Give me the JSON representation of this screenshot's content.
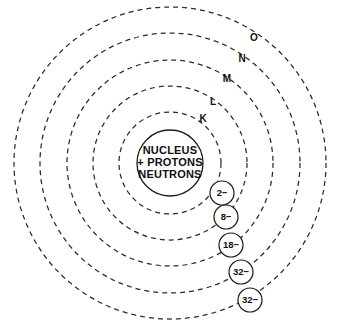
{
  "diagram": {
    "background_color": "#ffffff",
    "stroke_color": "#2b2b2b",
    "text_color": "#111111",
    "center": {
      "x": 170,
      "y": 163
    }
  },
  "nucleus": {
    "radius": 33,
    "line1": "NUCLEUS",
    "line2": "+ PROTONS",
    "line3": "NEUTRONS"
  },
  "chart_data": {
    "type": "diagram",
    "shells": [
      {
        "label": "K",
        "electrons": "2−",
        "radius": 51,
        "label_x": 203,
        "label_y": 119,
        "bubble_x": 222,
        "bubble_y": 193
      },
      {
        "label": "L",
        "electrons": "8−",
        "radius": 77,
        "label_x": 213,
        "label_y": 102,
        "bubble_x": 226,
        "bubble_y": 217
      },
      {
        "label": "M",
        "electrons": "18−",
        "radius": 103,
        "label_x": 227,
        "label_y": 79,
        "bubble_x": 231,
        "bubble_y": 245
      },
      {
        "label": "N",
        "electrons": "32−",
        "radius": 130,
        "label_x": 242,
        "label_y": 59,
        "bubble_x": 241,
        "bubble_y": 272
      },
      {
        "label": "O",
        "electrons": "32−",
        "radius": 156,
        "label_x": 254,
        "label_y": 38,
        "bubble_x": 250,
        "bubble_y": 300
      }
    ],
    "bubble_radius": 12
  }
}
